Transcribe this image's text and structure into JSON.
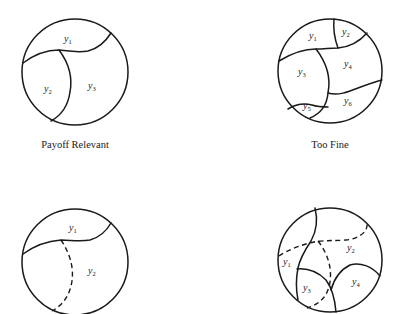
{
  "figure": {
    "panels": [
      {
        "id": "payoff-relevant",
        "caption": "Payoff Relevant",
        "labels": [
          {
            "base": "y",
            "sub": "1"
          },
          {
            "base": "y",
            "sub": "2"
          },
          {
            "base": "y",
            "sub": "3"
          }
        ]
      },
      {
        "id": "too-fine",
        "caption": "Too Fine",
        "labels": [
          {
            "base": "y",
            "sub": "1"
          },
          {
            "base": "y",
            "sub": "2"
          },
          {
            "base": "y",
            "sub": "3"
          },
          {
            "base": "y",
            "sub": "4"
          },
          {
            "base": "y",
            "sub": "5"
          },
          {
            "base": "y",
            "sub": "6"
          }
        ]
      },
      {
        "id": "coarse",
        "caption": "",
        "labels": [
          {
            "base": "y",
            "sub": "1"
          },
          {
            "base": "y",
            "sub": "2"
          }
        ]
      },
      {
        "id": "mixed",
        "caption": "",
        "labels": [
          {
            "base": "y",
            "sub": "1"
          },
          {
            "base": "y",
            "sub": "2"
          },
          {
            "base": "y",
            "sub": "3"
          },
          {
            "base": "y",
            "sub": "4"
          }
        ]
      }
    ]
  }
}
